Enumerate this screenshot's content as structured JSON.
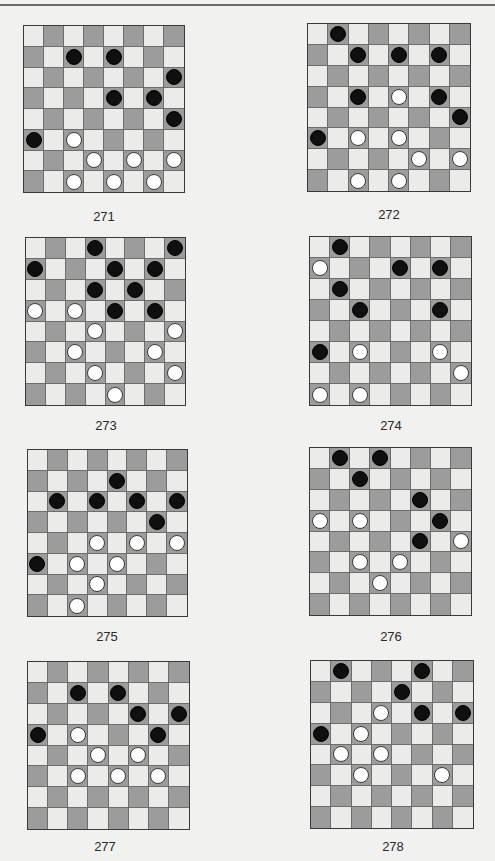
{
  "page": {
    "header_text": "",
    "colors": {
      "background": "#f1f1ef",
      "light_square": "#ebebea",
      "dark_square": "#9c9c9c",
      "black_piece": "#0f0f0f",
      "white_piece": "#ffffff"
    }
  },
  "puzzles": [
    {
      "number": "271",
      "board": {
        "x": 23,
        "y": 25,
        "w": 162,
        "h": 168
      },
      "label_pos": {
        "x": 64,
        "y": 209
      },
      "pieces": [
        {
          "row": 1,
          "col": 2,
          "color": "black"
        },
        {
          "row": 1,
          "col": 4,
          "color": "black"
        },
        {
          "row": 2,
          "col": 7,
          "color": "black"
        },
        {
          "row": 3,
          "col": 4,
          "color": "black"
        },
        {
          "row": 3,
          "col": 6,
          "color": "black"
        },
        {
          "row": 4,
          "col": 7,
          "color": "black"
        },
        {
          "row": 5,
          "col": 0,
          "color": "black"
        },
        {
          "row": 5,
          "col": 2,
          "color": "white"
        },
        {
          "row": 6,
          "col": 3,
          "color": "white"
        },
        {
          "row": 6,
          "col": 5,
          "color": "white"
        },
        {
          "row": 6,
          "col": 7,
          "color": "white"
        },
        {
          "row": 7,
          "col": 2,
          "color": "white"
        },
        {
          "row": 7,
          "col": 4,
          "color": "white"
        },
        {
          "row": 7,
          "col": 6,
          "color": "white"
        }
      ]
    },
    {
      "number": "272",
      "board": {
        "x": 307,
        "y": 23,
        "w": 164,
        "h": 169
      },
      "label_pos": {
        "x": 349,
        "y": 207
      },
      "pieces": [
        {
          "row": 0,
          "col": 1,
          "color": "black"
        },
        {
          "row": 1,
          "col": 2,
          "color": "black"
        },
        {
          "row": 1,
          "col": 4,
          "color": "black"
        },
        {
          "row": 1,
          "col": 6,
          "color": "black"
        },
        {
          "row": 3,
          "col": 2,
          "color": "black"
        },
        {
          "row": 3,
          "col": 4,
          "color": "white"
        },
        {
          "row": 3,
          "col": 6,
          "color": "black"
        },
        {
          "row": 4,
          "col": 7,
          "color": "black"
        },
        {
          "row": 5,
          "col": 0,
          "color": "black"
        },
        {
          "row": 5,
          "col": 2,
          "color": "white"
        },
        {
          "row": 5,
          "col": 4,
          "color": "white"
        },
        {
          "row": 6,
          "col": 5,
          "color": "white"
        },
        {
          "row": 6,
          "col": 7,
          "color": "white"
        },
        {
          "row": 7,
          "col": 2,
          "color": "white"
        },
        {
          "row": 7,
          "col": 4,
          "color": "white"
        }
      ]
    },
    {
      "number": "273",
      "board": {
        "x": 25,
        "y": 237,
        "w": 161,
        "h": 169
      },
      "label_pos": {
        "x": 66,
        "y": 418
      },
      "pieces": [
        {
          "row": 0,
          "col": 3,
          "color": "black"
        },
        {
          "row": 0,
          "col": 7,
          "color": "black"
        },
        {
          "row": 1,
          "col": 0,
          "color": "black"
        },
        {
          "row": 1,
          "col": 4,
          "color": "black"
        },
        {
          "row": 1,
          "col": 6,
          "color": "black"
        },
        {
          "row": 2,
          "col": 3,
          "color": "black"
        },
        {
          "row": 2,
          "col": 5,
          "color": "black"
        },
        {
          "row": 3,
          "col": 0,
          "color": "white"
        },
        {
          "row": 3,
          "col": 2,
          "color": "white"
        },
        {
          "row": 3,
          "col": 4,
          "color": "black"
        },
        {
          "row": 3,
          "col": 6,
          "color": "black"
        },
        {
          "row": 4,
          "col": 3,
          "color": "white"
        },
        {
          "row": 4,
          "col": 7,
          "color": "white"
        },
        {
          "row": 5,
          "col": 2,
          "color": "white"
        },
        {
          "row": 5,
          "col": 6,
          "color": "white"
        },
        {
          "row": 6,
          "col": 3,
          "color": "white"
        },
        {
          "row": 6,
          "col": 7,
          "color": "white"
        },
        {
          "row": 7,
          "col": 4,
          "color": "white"
        }
      ]
    },
    {
      "number": "274",
      "board": {
        "x": 309,
        "y": 236,
        "w": 163,
        "h": 170
      },
      "label_pos": {
        "x": 351,
        "y": 418
      },
      "pieces": [
        {
          "row": 0,
          "col": 1,
          "color": "black"
        },
        {
          "row": 1,
          "col": 0,
          "color": "white"
        },
        {
          "row": 1,
          "col": 4,
          "color": "black"
        },
        {
          "row": 1,
          "col": 6,
          "color": "black"
        },
        {
          "row": 2,
          "col": 1,
          "color": "black"
        },
        {
          "row": 3,
          "col": 2,
          "color": "black"
        },
        {
          "row": 3,
          "col": 6,
          "color": "black"
        },
        {
          "row": 5,
          "col": 0,
          "color": "black"
        },
        {
          "row": 5,
          "col": 2,
          "color": "white"
        },
        {
          "row": 5,
          "col": 6,
          "color": "white"
        },
        {
          "row": 6,
          "col": 7,
          "color": "white"
        },
        {
          "row": 7,
          "col": 0,
          "color": "white"
        },
        {
          "row": 7,
          "col": 2,
          "color": "white"
        }
      ]
    },
    {
      "number": "275",
      "board": {
        "x": 27,
        "y": 449,
        "w": 161,
        "h": 168
      },
      "label_pos": {
        "x": 67,
        "y": 629
      },
      "pieces": [
        {
          "row": 1,
          "col": 4,
          "color": "black"
        },
        {
          "row": 2,
          "col": 1,
          "color": "black"
        },
        {
          "row": 2,
          "col": 3,
          "color": "black"
        },
        {
          "row": 2,
          "col": 5,
          "color": "black"
        },
        {
          "row": 2,
          "col": 7,
          "color": "black"
        },
        {
          "row": 3,
          "col": 6,
          "color": "black"
        },
        {
          "row": 4,
          "col": 3,
          "color": "white"
        },
        {
          "row": 4,
          "col": 5,
          "color": "white"
        },
        {
          "row": 4,
          "col": 7,
          "color": "white"
        },
        {
          "row": 5,
          "col": 0,
          "color": "black"
        },
        {
          "row": 5,
          "col": 2,
          "color": "white"
        },
        {
          "row": 5,
          "col": 4,
          "color": "white"
        },
        {
          "row": 6,
          "col": 3,
          "color": "white"
        },
        {
          "row": 7,
          "col": 2,
          "color": "white"
        }
      ]
    },
    {
      "number": "276",
      "board": {
        "x": 309,
        "y": 447,
        "w": 163,
        "h": 169
      },
      "label_pos": {
        "x": 351,
        "y": 629
      },
      "pieces": [
        {
          "row": 0,
          "col": 1,
          "color": "black"
        },
        {
          "row": 0,
          "col": 3,
          "color": "black"
        },
        {
          "row": 1,
          "col": 2,
          "color": "black"
        },
        {
          "row": 2,
          "col": 5,
          "color": "black"
        },
        {
          "row": 3,
          "col": 0,
          "color": "white"
        },
        {
          "row": 3,
          "col": 2,
          "color": "white"
        },
        {
          "row": 3,
          "col": 6,
          "color": "black"
        },
        {
          "row": 4,
          "col": 5,
          "color": "black"
        },
        {
          "row": 4,
          "col": 7,
          "color": "white"
        },
        {
          "row": 5,
          "col": 2,
          "color": "white"
        },
        {
          "row": 5,
          "col": 4,
          "color": "white"
        },
        {
          "row": 6,
          "col": 3,
          "color": "white"
        }
      ]
    },
    {
      "number": "277",
      "board": {
        "x": 27,
        "y": 661,
        "w": 163,
        "h": 169
      },
      "label_pos": {
        "x": 65,
        "y": 839
      },
      "pieces": [
        {
          "row": 1,
          "col": 2,
          "color": "black"
        },
        {
          "row": 1,
          "col": 4,
          "color": "black"
        },
        {
          "row": 2,
          "col": 5,
          "color": "black"
        },
        {
          "row": 2,
          "col": 7,
          "color": "black"
        },
        {
          "row": 3,
          "col": 0,
          "color": "black"
        },
        {
          "row": 3,
          "col": 2,
          "color": "white"
        },
        {
          "row": 3,
          "col": 6,
          "color": "black"
        },
        {
          "row": 4,
          "col": 3,
          "color": "white"
        },
        {
          "row": 4,
          "col": 5,
          "color": "white"
        },
        {
          "row": 5,
          "col": 2,
          "color": "white"
        },
        {
          "row": 5,
          "col": 4,
          "color": "white"
        },
        {
          "row": 5,
          "col": 6,
          "color": "white"
        }
      ]
    },
    {
      "number": "278",
      "board": {
        "x": 310,
        "y": 660,
        "w": 164,
        "h": 169
      },
      "label_pos": {
        "x": 353,
        "y": 839
      },
      "pieces": [
        {
          "row": 0,
          "col": 1,
          "color": "black"
        },
        {
          "row": 0,
          "col": 5,
          "color": "black"
        },
        {
          "row": 1,
          "col": 4,
          "color": "black"
        },
        {
          "row": 2,
          "col": 3,
          "color": "white"
        },
        {
          "row": 2,
          "col": 5,
          "color": "black"
        },
        {
          "row": 2,
          "col": 7,
          "color": "black"
        },
        {
          "row": 3,
          "col": 0,
          "color": "black"
        },
        {
          "row": 3,
          "col": 2,
          "color": "white"
        },
        {
          "row": 4,
          "col": 1,
          "color": "white"
        },
        {
          "row": 4,
          "col": 3,
          "color": "white"
        },
        {
          "row": 5,
          "col": 2,
          "color": "white"
        },
        {
          "row": 5,
          "col": 6,
          "color": "white"
        }
      ]
    }
  ]
}
